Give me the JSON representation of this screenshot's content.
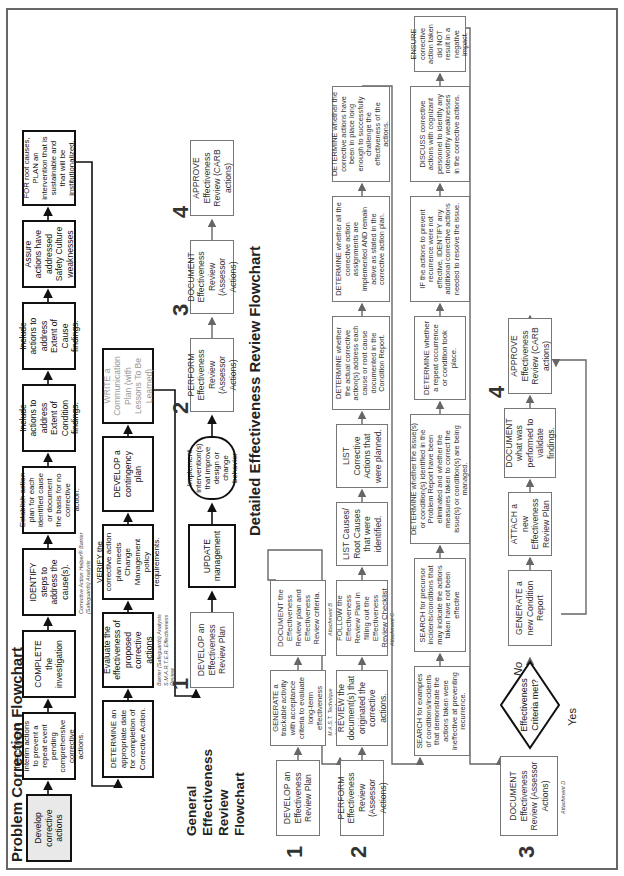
{
  "problem_correction": {
    "title": "Problem Correction Flowchart",
    "row1": [
      "Develop corrective actions",
      "IMPLEMENT interim actions to prevent a repeat event pending comprehensive corrective actions.",
      "COMPLETE the investigation",
      "IDENTIFY steps to address the cause(s).",
      "Establish action plan for each identified cause or document the basis for no corrective action.",
      "Include actions to address Extent of Condition findings.",
      "Include actions to address Extent of Cause findings.",
      "Assure actions have addressed Safety Culture weaknesses",
      "FOR root causes, PLAN an intervention that is sustainable and that will be institutionalized."
    ],
    "row1_note": "Corrective Action Helper® Barrier (Safeguards) Analysis",
    "row2": [
      "DETERMINE an appropriate date for completion of Corrective Action.",
      "Evaluate the effectiveness of proposed corrective actions",
      "VERIFY the corrective action plan meets Change Management policy requirements.",
      "DEVELOP a contingency plan",
      "WRITE a Communication Plan (with Lessons To Be Learned)"
    ],
    "row2_note": "Barrier (Safeguards) Analysis S.M.A.R.T.E.R. Effectiveness Review"
  },
  "general_review": {
    "title": "General Effectiveness Review Flowchart",
    "steps": [
      {
        "num": "1",
        "text": "DEVELOP an Effectiveness Review Plan"
      },
      {
        "num": "",
        "text": "UPDATE management"
      },
      {
        "num": "",
        "text": "Implement intervention(s) that improve design or change behavior"
      },
      {
        "num": "2",
        "text": "PERFORM Effectiveness Review (Assessor Actions)"
      },
      {
        "num": "3",
        "text": "DOCUMENT Effectiveness Review (Assessor Actions)"
      },
      {
        "num": "4",
        "text": "APPROVE Effectiveness Review (CARB actions)"
      }
    ]
  },
  "detailed_review": {
    "title": "Detailed Effectiveness Review Flowchart",
    "row1": {
      "num": "1",
      "boxes": [
        "DEVELOP an Effectiveness Review Plan",
        "GENERATE a trackable activity with acceptance criteria to evaluate long-term effectiveness",
        "DOCUMENT the Effectiveness Review plan and Effectiveness Review criteria."
      ],
      "notes": [
        "M.A.S.T. Technique Attachment A",
        "Attachment B"
      ]
    },
    "row2": {
      "num": "2",
      "boxes": [
        "PERFORM Effectiveness Review (Assessor Actions)",
        "REVIEW the document(s) that originated the corrective actions.",
        "FOLLOW the Effectiveness Review Plan in filling out the Effectiveness Review Checklist",
        "LIST Causes/ Root Causes that were identified.",
        "LIST Corrective Actions that were planned.",
        "DETERMINE whether the actual corrective action(s) address each cause or root cause documented in the Condition Report.",
        "DETERMINE whether all the corrective action assignments are implemented AND remain active as stated in the corrective action plan.",
        "DETERMINE whether the corrective actions have been in place long enough to successfully challenge the effectiveness of the actions."
      ],
      "note": "Attachment C"
    },
    "row3": {
      "boxes": [
        "SEARCH for examples of conditions/incidents that demonstrate the actions taken were ineffective at preventing recurrence.",
        "SEARCH for precursor incidents/conditions that may indicate the actions taken have not been effective",
        "DETERMINE whether the issue(s) or condition(s) identified in the Problem Report have been eliminated and whether the measures taken to correct the issue(s) or condition(s) are being managed.",
        "DETERMINE whether a repeat occurrence or condition took place.",
        "IF the actions to prevent recurrence were not effective, IDENTIFY any additional corrective actions needed to resolve the issue.",
        "DISCUSS corrective actions with cognizant personnel to identify any noteworthy weaknesses in the corrective actions.",
        "ENSURE corrective action taken did NOT result in a negative impact."
      ]
    },
    "row4": {
      "num3": "3",
      "num4": "4",
      "document": "DOCUMENT Effectiveness Review (Assessor Actions)",
      "document_note": "Attachment D",
      "decision": "Effectiveness Criteria met?",
      "no_label": "No",
      "yes_label": "Yes",
      "boxes": [
        "GENERATE a new Condition Report",
        "ATTACH a new Effectiveness Review Plan",
        "DOCUMENT what was performed to validate findings.",
        "APPROVE Effectiveness Review (CARB actions)"
      ]
    }
  }
}
